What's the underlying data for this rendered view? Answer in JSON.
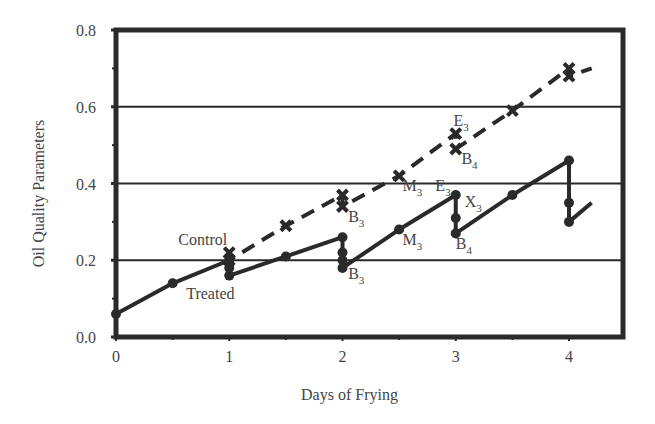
{
  "chart_data": {
    "type": "line",
    "title": "",
    "xlabel": "Days of Frying",
    "ylabel": "Oil Quality Parameters",
    "xlim": [
      0,
      4.2
    ],
    "ylim": [
      0.0,
      0.8
    ],
    "x_ticks": [
      0,
      1,
      2,
      3,
      4
    ],
    "x_tick_labels": [
      "0",
      "1",
      "2",
      "3",
      "4"
    ],
    "y_ticks": [
      0.0,
      0.2,
      0.4,
      0.6,
      0.8
    ],
    "y_tick_labels": [
      "0.0",
      "0.2",
      "0.4",
      "0.6",
      "0.8"
    ],
    "grid": {
      "horizontal": [
        0.2,
        0.4,
        0.6
      ],
      "vertical": false
    },
    "legend": "inline labels",
    "series": [
      {
        "name": "Control",
        "style": "dashed",
        "marker": "x",
        "color": "#2a2a2a",
        "points": [
          [
            1.0,
            0.22
          ],
          [
            1.0,
            0.2
          ],
          [
            1.5,
            0.29
          ],
          [
            2.0,
            0.37
          ],
          [
            2.0,
            0.34
          ],
          [
            2.5,
            0.42
          ],
          [
            3.0,
            0.53
          ],
          [
            3.0,
            0.49
          ],
          [
            3.5,
            0.59
          ],
          [
            4.0,
            0.7
          ],
          [
            4.0,
            0.68
          ],
          [
            4.2,
            0.7
          ]
        ]
      },
      {
        "name": "Treated",
        "style": "solid",
        "marker": "circle",
        "color": "#2a2a2a",
        "points": [
          [
            0.0,
            0.06
          ],
          [
            0.5,
            0.14
          ],
          [
            1.0,
            0.2
          ],
          [
            1.0,
            0.18
          ],
          [
            1.0,
            0.16
          ],
          [
            1.5,
            0.21
          ],
          [
            2.0,
            0.26
          ],
          [
            2.0,
            0.22
          ],
          [
            2.0,
            0.2
          ],
          [
            2.0,
            0.18
          ],
          [
            2.5,
            0.28
          ],
          [
            3.0,
            0.37
          ],
          [
            3.0,
            0.31
          ],
          [
            3.0,
            0.27
          ],
          [
            3.5,
            0.37
          ],
          [
            4.0,
            0.46
          ],
          [
            4.0,
            0.35
          ],
          [
            4.0,
            0.3
          ],
          [
            4.2,
            0.35
          ]
        ]
      }
    ],
    "annotations": [
      {
        "text": "Control",
        "x": 0.55,
        "y": 0.24
      },
      {
        "text": "Treated",
        "x": 0.62,
        "y": 0.1
      },
      {
        "text": "B",
        "sub": "3",
        "x": 2.05,
        "y": 0.3,
        "series": "Control"
      },
      {
        "text": "M",
        "sub": "3",
        "x": 2.53,
        "y": 0.38,
        "series": "Control"
      },
      {
        "text": "E",
        "sub": "3",
        "x": 2.98,
        "y": 0.55,
        "series": "Control"
      },
      {
        "text": "B",
        "sub": "4",
        "x": 3.05,
        "y": 0.45,
        "series": "Control"
      },
      {
        "text": "B",
        "sub": "3",
        "x": 2.05,
        "y": 0.15,
        "series": "Treated"
      },
      {
        "text": "M",
        "sub": "3",
        "x": 2.53,
        "y": 0.24,
        "series": "Treated"
      },
      {
        "text": "E",
        "sub": "3",
        "x": 2.82,
        "y": 0.38,
        "series": "Treated"
      },
      {
        "text": "X",
        "sub": "3",
        "x": 3.08,
        "y": 0.34,
        "series": "Treated"
      },
      {
        "text": "B",
        "sub": "4",
        "x": 3.0,
        "y": 0.23,
        "series": "Treated"
      }
    ]
  }
}
